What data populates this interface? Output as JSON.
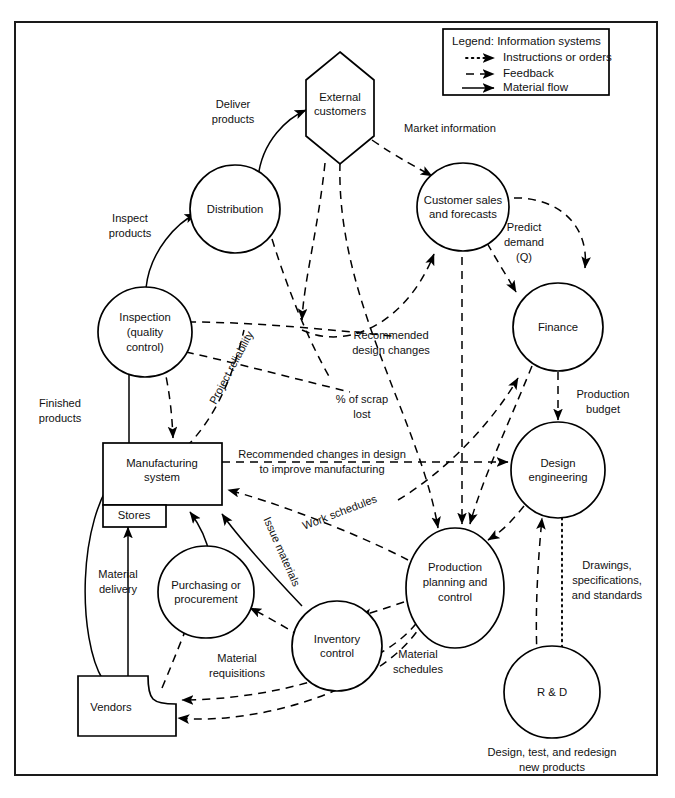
{
  "diagram": {
    "frame": {
      "stroke": "#1a1a1a"
    }
  },
  "legend": {
    "title": "Legend: Information systems",
    "items": [
      {
        "label": "Instructions or orders",
        "style": "dotted"
      },
      {
        "label": "Feedback",
        "style": "dashed"
      },
      {
        "label": "Material flow",
        "style": "solid"
      }
    ]
  },
  "nodes": [
    {
      "id": "external-customers",
      "label": "External\ncustomers",
      "line1": "External",
      "line2": "customers",
      "shape": "hexagon"
    },
    {
      "id": "distribution",
      "label": "Distribution",
      "line1": "Distribution",
      "line2": "",
      "shape": "circle"
    },
    {
      "id": "customer-sales",
      "label": "Customer sales and forecasts",
      "line1": "Customer sales",
      "line2": "and forecasts",
      "shape": "circle"
    },
    {
      "id": "finance",
      "label": "Finance",
      "line1": "Finance",
      "line2": "",
      "shape": "circle"
    },
    {
      "id": "inspection",
      "label": "Inspection (quality control)",
      "line1": "Inspection",
      "line2": "(quality",
      "line3": "control)",
      "shape": "circle"
    },
    {
      "id": "manufacturing-system",
      "label": "Manufacturing system",
      "line1": "Manufacturing",
      "line2": "system",
      "shape": "rectangle"
    },
    {
      "id": "stores",
      "label": "Stores",
      "line1": "Stores",
      "line2": "",
      "shape": "rectangle"
    },
    {
      "id": "design-engineering",
      "label": "Design engineering",
      "line1": "Design",
      "line2": "engineering",
      "shape": "circle"
    },
    {
      "id": "purchasing",
      "label": "Purchasing or procurement",
      "line1": "Purchasing or",
      "line2": "procurement",
      "shape": "circle"
    },
    {
      "id": "production-planning",
      "label": "Production planning and control",
      "line1": "Production",
      "line2": "planning and",
      "line3": "control",
      "shape": "circle"
    },
    {
      "id": "inventory-control",
      "label": "Inventory control",
      "line1": "Inventory",
      "line2": "control",
      "shape": "circle"
    },
    {
      "id": "rnd",
      "label": "R & D",
      "line1": "R & D",
      "line2": "",
      "shape": "circle"
    },
    {
      "id": "vendors",
      "label": "Vendors",
      "line1": "Vendors",
      "line2": "",
      "shape": "notched-rectangle"
    }
  ],
  "edge_labels": {
    "deliver_products_1": "Deliver",
    "deliver_products_2": "products",
    "market_information": "Market information",
    "predict_demand_1": "Predict",
    "predict_demand_2": "demand",
    "predict_demand_3": "(Q)",
    "inspect_products_1": "Inspect",
    "inspect_products_2": "products",
    "recommended_design_changes_1": "Recommended",
    "recommended_design_changes_2": "design changes",
    "project_reliability": "Project reliability",
    "scrap_lost_1": "% of scrap",
    "scrap_lost_2": "lost",
    "production_budget_1": "Production",
    "production_budget_2": "budget",
    "finished_products_1": "Finished",
    "finished_products_2": "products",
    "recommended_changes_1": "Recommended changes in design",
    "recommended_changes_2": "to improve manufacturing",
    "work_schedules": "Work schedules",
    "issue_materials": "Issue materials",
    "material_delivery_1": "Material",
    "material_delivery_2": "delivery",
    "material_requisitions_1": "Material",
    "material_requisitions_2": "requisitions",
    "material_schedules_1": "Material",
    "material_schedules_2": "schedules",
    "drawings_1": "Drawings,",
    "drawings_2": "specifications,",
    "drawings_3": "and standards"
  },
  "caption": {
    "line1": "Design, test, and redesign",
    "line2": "new products"
  }
}
